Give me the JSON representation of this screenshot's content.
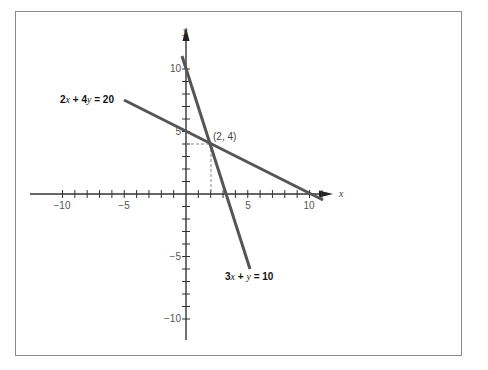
{
  "chart_data": {
    "type": "line",
    "title": "",
    "xlabel": "x",
    "ylabel": "y",
    "xlim": [
      -11.5,
      12
    ],
    "ylim": [
      -12,
      12
    ],
    "grid": false,
    "x_tick_labels": [
      "-10",
      "-5",
      "5",
      "10"
    ],
    "y_tick_labels": [
      "10",
      "5",
      "-5",
      "-10"
    ],
    "series": [
      {
        "name": "2x + 4y = 20",
        "label": "2x + 4y = 20",
        "x": [
          -5,
          11
        ],
        "y": [
          7.5,
          -0.5
        ]
      },
      {
        "name": "3x + y = 10",
        "label": "3x + y = 10",
        "x": [
          -0.33,
          5.33
        ],
        "y": [
          11,
          -6
        ]
      }
    ],
    "annotations": [
      {
        "text": "(2, 4)",
        "x": 2,
        "y": 4,
        "type": "intersection-point",
        "dashed_guides": true
      }
    ]
  },
  "labels": {
    "x_axis": "x",
    "y_axis": "y",
    "x_ticks": {
      "neg10": "−10",
      "neg5": "−5",
      "pos5": "5",
      "pos10": "10"
    },
    "y_ticks": {
      "pos10": "10",
      "pos5": "5",
      "neg5": "−5",
      "neg10": "−10"
    },
    "eq1_coef_a": "2",
    "eq1_var_x": "x",
    "eq1_plus": " + 4",
    "eq1_var_y": "y",
    "eq1_rhs": " = 20",
    "eq2_coef_a": "3",
    "eq2_var_x": "x",
    "eq2_plus": " + ",
    "eq2_var_y": "y",
    "eq2_rhs": " = 10",
    "intersection": "(2, 4)"
  },
  "colors": {
    "line": "#555555",
    "axis": "#333333",
    "frame": "#8a8a8a",
    "dash": "#888888"
  }
}
